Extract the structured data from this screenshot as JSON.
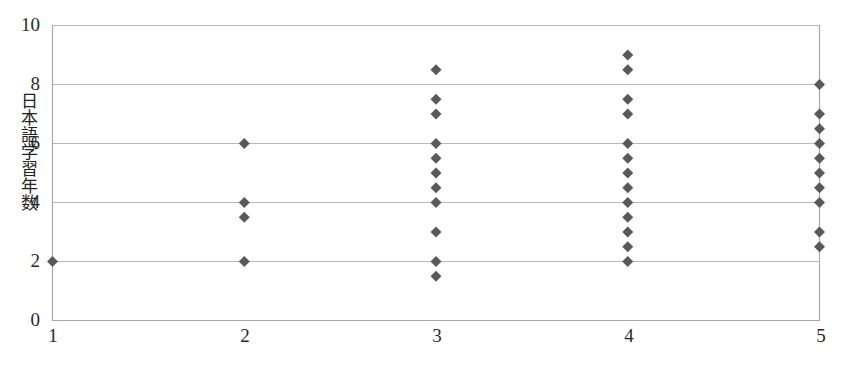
{
  "chart_data": {
    "type": "scatter",
    "title": "",
    "subtitle": "",
    "xlabel": "",
    "ylabel": "日本語学習年数",
    "xlim": [
      1,
      5
    ],
    "ylim": [
      0,
      10
    ],
    "x_ticks": [
      "1",
      "2",
      "3",
      "4",
      "5"
    ],
    "y_ticks": [
      "0",
      "2",
      "4",
      "6",
      "8",
      "10"
    ],
    "grid": "horizontal",
    "legend": "none",
    "marker": {
      "shape": "diamond",
      "color": "#595959",
      "size": 11
    },
    "series": [
      {
        "name": "日本語学習年数",
        "points": [
          {
            "x": 1,
            "y": 2
          },
          {
            "x": 2,
            "y": 6
          },
          {
            "x": 2,
            "y": 4
          },
          {
            "x": 2,
            "y": 3.5
          },
          {
            "x": 2,
            "y": 2
          },
          {
            "x": 3,
            "y": 8.5
          },
          {
            "x": 3,
            "y": 7.5
          },
          {
            "x": 3,
            "y": 7
          },
          {
            "x": 3,
            "y": 6
          },
          {
            "x": 3,
            "y": 5.5
          },
          {
            "x": 3,
            "y": 5
          },
          {
            "x": 3,
            "y": 4.5
          },
          {
            "x": 3,
            "y": 4
          },
          {
            "x": 3,
            "y": 3
          },
          {
            "x": 3,
            "y": 2
          },
          {
            "x": 3,
            "y": 1.5
          },
          {
            "x": 4,
            "y": 9
          },
          {
            "x": 4,
            "y": 8.5
          },
          {
            "x": 4,
            "y": 7.5
          },
          {
            "x": 4,
            "y": 7
          },
          {
            "x": 4,
            "y": 6
          },
          {
            "x": 4,
            "y": 5.5
          },
          {
            "x": 4,
            "y": 5
          },
          {
            "x": 4,
            "y": 4.5
          },
          {
            "x": 4,
            "y": 4
          },
          {
            "x": 4,
            "y": 3.5
          },
          {
            "x": 4,
            "y": 3
          },
          {
            "x": 4,
            "y": 2.5
          },
          {
            "x": 4,
            "y": 2
          },
          {
            "x": 5,
            "y": 8
          },
          {
            "x": 5,
            "y": 7
          },
          {
            "x": 5,
            "y": 6.5
          },
          {
            "x": 5,
            "y": 6
          },
          {
            "x": 5,
            "y": 5.5
          },
          {
            "x": 5,
            "y": 5
          },
          {
            "x": 5,
            "y": 4.5
          },
          {
            "x": 5,
            "y": 4
          },
          {
            "x": 5,
            "y": 3
          },
          {
            "x": 5,
            "y": 2.5
          }
        ]
      }
    ]
  },
  "axes": {
    "y_axis_title": "日本語学習年数",
    "y_tick_labels": [
      "10",
      "8",
      "6",
      "4",
      "2",
      "0"
    ],
    "x_tick_labels": [
      "1",
      "2",
      "3",
      "4",
      "5"
    ]
  },
  "colors": {
    "marker": "#595959",
    "gridline": "#b9b9b9",
    "axis": "#a8a8a8",
    "text": "#2a2a2a",
    "background": "#ffffff"
  }
}
